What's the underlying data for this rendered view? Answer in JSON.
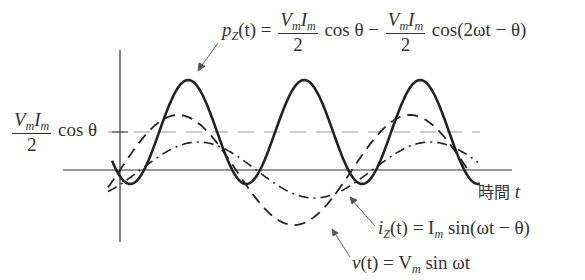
{
  "diagram": {
    "type": "ac-power-waveforms",
    "x_axis_label": {
      "text": "時間",
      "variable": "t"
    },
    "curves": [
      {
        "name": "p_Z(t)",
        "style": "solid",
        "label_lhs": "p",
        "label_sub": "Z",
        "label_arg": "(t) =",
        "term1_num": "V",
        "term1_num_sub1": "m",
        "term1_num_mid": "I",
        "term1_num_sub2": "m",
        "term1_den": "2",
        "term1_fn": "cos θ",
        "op": "−",
        "term2_num": "V",
        "term2_num_sub1": "m",
        "term2_num_mid": "I",
        "term2_num_sub2": "m",
        "term2_den": "2",
        "term2_fn": "cos(2ωt − θ)"
      },
      {
        "name": "i_Z(t)",
        "style": "dash-dot",
        "label_lhs": "i",
        "label_sub": "Z",
        "label_rhs_pre": "(t) = I",
        "label_rhs_sub": "m",
        "label_rhs_post": " sin(ωt − θ)"
      },
      {
        "name": "v(t)",
        "style": "dashed",
        "label_lhs": "v",
        "label_rhs_pre": "(t) = V",
        "label_rhs_sub": "m",
        "label_rhs_post": " sin ωt"
      }
    ],
    "average_level": {
      "num_v": "V",
      "num_sub1": "m",
      "num_i": "I",
      "num_sub2": "m",
      "den": "2",
      "fn": "cos θ"
    }
  },
  "colors": {
    "stroke": "#222222",
    "guide": "#999999",
    "background": "#ffffff"
  }
}
